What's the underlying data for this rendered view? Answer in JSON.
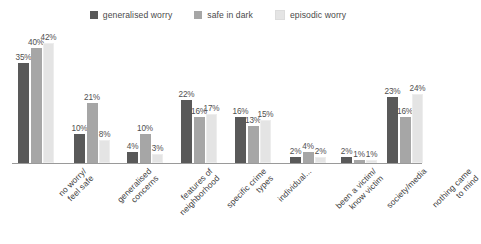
{
  "chart_data": {
    "type": "bar",
    "title": "",
    "subtitle": "",
    "xlabel": "",
    "ylabel": "",
    "ylim": [
      0,
      45
    ],
    "grid": false,
    "legend_position": "top-center",
    "value_label_suffix": "%",
    "categories": [
      "no worry/\nfeel safe",
      "generalised\nconcerns",
      "features of\nneighborhood",
      "specific crime\ntypes",
      "individual...",
      "been a victim/\nknow victim",
      "society/media",
      "nothing came\nto mind"
    ],
    "series": [
      {
        "name": "generalised worry",
        "color": "#595959",
        "values": [
          35,
          10,
          4,
          22,
          16,
          2,
          2,
          23
        ],
        "labels": [
          "35%",
          "10%",
          "4%",
          "22%",
          "16%",
          "2%",
          "2%",
          "23%"
        ]
      },
      {
        "name": "safe in dark",
        "color": "#a6a6a6",
        "values": [
          40,
          21,
          10,
          16,
          13,
          4,
          1,
          16
        ],
        "labels": [
          "40%",
          "21%",
          "10%",
          "16%",
          "13%",
          "4%",
          "1%",
          "16%"
        ]
      },
      {
        "name": "episodic worry",
        "color": "#e4e4e4",
        "values": [
          42,
          8,
          3,
          17,
          15,
          2,
          1,
          24
        ],
        "labels": [
          "42%",
          "8%",
          "3%",
          "17%",
          "15%",
          "2%",
          "1%",
          "24%"
        ]
      }
    ]
  },
  "legend": {
    "items": [
      {
        "label": "generalised worry",
        "color": "#595959"
      },
      {
        "label": "safe in dark",
        "color": "#a6a6a6"
      },
      {
        "label": "episodic worry",
        "color": "#e4e4e4"
      }
    ]
  }
}
